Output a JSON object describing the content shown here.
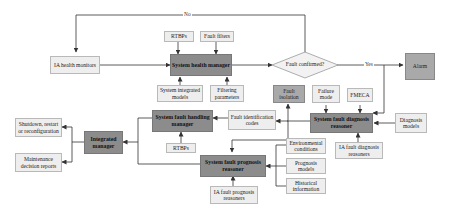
{
  "diagram": {
    "nodes": {
      "ia_health_monitors": "IA health monitors",
      "rtbps_top": "RTBPs",
      "fault_filters": "Fault filters",
      "system_health_manager": "System health manager",
      "system_integrated_models": "System integrated models",
      "filtering_parameters": "Filtering parameters",
      "fault_confirmed": "Fault confirmed?",
      "alarm": "Alarm",
      "fault_isolation": "Fault isolation",
      "failure_mode": "Failure mode",
      "fmeca": "FMECA",
      "system_fault_diagnosis_reasoner": "System fault diagnosis reasoner",
      "diagnosis_models": "Diagnosis models",
      "ia_fault_diagnosis_reasoners": "IA fault diagnosis reasoners",
      "fault_identification_codes": "Fault identification codes",
      "system_fault_handling_manager": "System fault handling manager",
      "rtbps_bottom": "RTBPs",
      "integrated_manager": "Integrated manager",
      "shutdown_restart": "Shutdown, restart or reconfiguration",
      "maintenance_decision_reports": "Maintenance decision reports",
      "system_fault_prognosis_reasoner": "System fault prognosis reasoner",
      "environmental_conditions": "Environmental conditions",
      "prognosis_models": "Prognosis models",
      "historical_information": "Historical information",
      "ia_fault_prognosis_reasoners": "IA fault prognosis reasoners"
    },
    "edge_labels": {
      "no": "No",
      "yes": "Yes"
    },
    "colors": {
      "dark_node": "#8c8c8c",
      "mid_node": "#a9a9a9",
      "light_node": "#eeeeee",
      "line": "#333333"
    }
  }
}
